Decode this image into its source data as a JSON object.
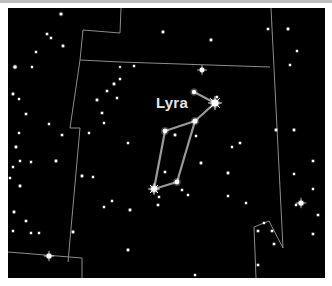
{
  "chart_title": "Lyra",
  "constellation": {
    "name": "Lyra",
    "label_position": [
      156,
      108
    ],
    "stick_figure": [
      [
        194,
        92
      ],
      [
        215,
        103
      ],
      [
        195,
        121
      ],
      [
        177,
        182
      ],
      [
        154,
        189
      ],
      [
        165,
        131
      ],
      [
        195,
        121
      ]
    ],
    "line_color": "#9a9a9a"
  },
  "colors": {
    "sky": "#000000",
    "border": "#ffffff",
    "boundary": "#8c8c8c",
    "star": "#ffffff",
    "label": "#e6e6e6"
  },
  "boundaries": [
    [
      [
        121,
        8
      ],
      [
        120,
        33
      ],
      [
        83,
        30
      ],
      [
        80,
        60
      ],
      [
        70,
        128
      ]
    ],
    [
      [
        70,
        128
      ],
      [
        80,
        128
      ],
      [
        68,
        262
      ]
    ],
    [
      [
        8,
        252
      ],
      [
        82,
        258
      ]
    ],
    [
      [
        82,
        258
      ],
      [
        82,
        278
      ]
    ],
    [
      [
        271,
        8
      ],
      [
        283,
        248
      ]
    ],
    [
      [
        283,
        248
      ],
      [
        269,
        221
      ],
      [
        254,
        227
      ],
      [
        256,
        278
      ]
    ],
    [
      [
        80,
        60
      ],
      [
        120,
        62
      ],
      [
        270,
        67
      ]
    ]
  ],
  "stars": [
    {
      "x": 61,
      "y": 14,
      "r": 1.6
    },
    {
      "x": 47,
      "y": 34,
      "r": 1.3
    },
    {
      "x": 51,
      "y": 38,
      "r": 1.2
    },
    {
      "x": 63,
      "y": 46,
      "r": 1.4
    },
    {
      "x": 36,
      "y": 52,
      "r": 1.2
    },
    {
      "x": 15,
      "y": 67,
      "r": 1.8
    },
    {
      "x": 32,
      "y": 67,
      "r": 1.2
    },
    {
      "x": 120,
      "y": 67,
      "r": 1.1
    },
    {
      "x": 13,
      "y": 94,
      "r": 1.4
    },
    {
      "x": 19,
      "y": 99,
      "r": 1.2
    },
    {
      "x": 26,
      "y": 114,
      "r": 1.3
    },
    {
      "x": 49,
      "y": 124,
      "r": 1.2
    },
    {
      "x": 62,
      "y": 135,
      "r": 1.3
    },
    {
      "x": 19,
      "y": 133,
      "r": 1.2
    },
    {
      "x": 16,
      "y": 147,
      "r": 1.4
    },
    {
      "x": 20,
      "y": 161,
      "r": 1.2
    },
    {
      "x": 31,
      "y": 162,
      "r": 1.2
    },
    {
      "x": 56,
      "y": 161,
      "r": 1.4
    },
    {
      "x": 13,
      "y": 167,
      "r": 1.2
    },
    {
      "x": 10,
      "y": 178,
      "r": 1.2
    },
    {
      "x": 20,
      "y": 186,
      "r": 1.4
    },
    {
      "x": 14,
      "y": 212,
      "r": 1.4
    },
    {
      "x": 26,
      "y": 221,
      "r": 1.3
    },
    {
      "x": 13,
      "y": 231,
      "r": 1.2
    },
    {
      "x": 31,
      "y": 233,
      "r": 1.2
    },
    {
      "x": 39,
      "y": 233,
      "r": 1.2
    },
    {
      "x": 73,
      "y": 232,
      "r": 1.4
    },
    {
      "x": 49,
      "y": 256,
      "r": 2.6
    },
    {
      "x": 163,
      "y": 32,
      "r": 1.4
    },
    {
      "x": 211,
      "y": 40,
      "r": 1.4
    },
    {
      "x": 268,
      "y": 29,
      "r": 1.3
    },
    {
      "x": 288,
      "y": 29,
      "r": 1.4
    },
    {
      "x": 297,
      "y": 51,
      "r": 1.2
    },
    {
      "x": 290,
      "y": 65,
      "r": 1.2
    },
    {
      "x": 202,
      "y": 70,
      "r": 2.4
    },
    {
      "x": 134,
      "y": 66,
      "r": 1.2
    },
    {
      "x": 120,
      "y": 79,
      "r": 1.2
    },
    {
      "x": 114,
      "y": 84,
      "r": 1.4
    },
    {
      "x": 107,
      "y": 91,
      "r": 1.3
    },
    {
      "x": 97,
      "y": 100,
      "r": 1.4
    },
    {
      "x": 102,
      "y": 113,
      "r": 1.3
    },
    {
      "x": 117,
      "y": 98,
      "r": 1.2
    },
    {
      "x": 89,
      "y": 133,
      "r": 1.2
    },
    {
      "x": 104,
      "y": 123,
      "r": 1.2
    },
    {
      "x": 128,
      "y": 143,
      "r": 1.2
    },
    {
      "x": 82,
      "y": 176,
      "r": 1.4
    },
    {
      "x": 93,
      "y": 177,
      "r": 1.2
    },
    {
      "x": 217,
      "y": 97,
      "r": 1.2
    },
    {
      "x": 175,
      "y": 135,
      "r": 1.4
    },
    {
      "x": 196,
      "y": 136,
      "r": 1.2
    },
    {
      "x": 201,
      "y": 163,
      "r": 1.4
    },
    {
      "x": 165,
      "y": 172,
      "r": 1.3
    },
    {
      "x": 182,
      "y": 190,
      "r": 1.2
    },
    {
      "x": 159,
      "y": 197,
      "r": 1.2
    },
    {
      "x": 158,
      "y": 205,
      "r": 1.3
    },
    {
      "x": 188,
      "y": 195,
      "r": 1.2
    },
    {
      "x": 130,
      "y": 210,
      "r": 1.4
    },
    {
      "x": 240,
      "y": 143,
      "r": 1.3
    },
    {
      "x": 276,
      "y": 130,
      "r": 1.4
    },
    {
      "x": 294,
      "y": 130,
      "r": 1.4
    },
    {
      "x": 313,
      "y": 161,
      "r": 1.3
    },
    {
      "x": 228,
      "y": 173,
      "r": 1.4
    },
    {
      "x": 294,
      "y": 174,
      "r": 1.2
    },
    {
      "x": 313,
      "y": 189,
      "r": 1.2
    },
    {
      "x": 301,
      "y": 203,
      "r": 2.6
    },
    {
      "x": 296,
      "y": 205,
      "r": 1.2
    },
    {
      "x": 318,
      "y": 215,
      "r": 1.3
    },
    {
      "x": 313,
      "y": 234,
      "r": 1.3
    },
    {
      "x": 232,
      "y": 147,
      "r": 1.2
    },
    {
      "x": 228,
      "y": 196,
      "r": 1.2
    },
    {
      "x": 258,
      "y": 231,
      "r": 1.3
    },
    {
      "x": 272,
      "y": 231,
      "r": 1.3
    },
    {
      "x": 274,
      "y": 244,
      "r": 1.3
    },
    {
      "x": 246,
      "y": 203,
      "r": 1.2
    },
    {
      "x": 258,
      "y": 265,
      "r": 1.3
    },
    {
      "x": 128,
      "y": 250,
      "r": 1.4
    },
    {
      "x": 195,
      "y": 275,
      "r": 1.2
    },
    {
      "x": 104,
      "y": 207,
      "r": 1.2
    },
    {
      "x": 112,
      "y": 201,
      "r": 1.2
    },
    {
      "x": 264,
      "y": 223,
      "r": 1.2
    }
  ],
  "bright_stars": [
    {
      "name": "Vega",
      "x": 215,
      "y": 103,
      "r": 3.6
    },
    {
      "x": 154,
      "y": 189,
      "r": 3.0
    },
    {
      "x": 195,
      "y": 121,
      "r": 2.6
    },
    {
      "x": 165,
      "y": 131,
      "r": 2.4
    },
    {
      "x": 177,
      "y": 182,
      "r": 2.4
    },
    {
      "x": 194,
      "y": 92,
      "r": 2.2
    }
  ]
}
